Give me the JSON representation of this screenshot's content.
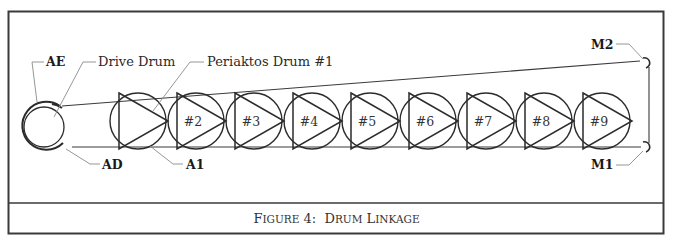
{
  "figure": {
    "caption": {
      "parts": [
        {
          "text": "F",
          "big": true
        },
        {
          "text": "IGURE",
          "big": false
        },
        {
          "text": " 4:  ",
          "big": true
        },
        {
          "text": "D",
          "big": true
        },
        {
          "text": "RUM",
          "big": false
        },
        {
          "text": " ",
          "big": true
        },
        {
          "text": "L",
          "big": true
        },
        {
          "text": "INKAGE",
          "big": false
        }
      ],
      "full_text": "Figure 4: Drum Linkage"
    },
    "callouts": {
      "ae": "AE",
      "drive_drum": "Drive Drum",
      "periaktos_drum_1": "Periaktos Drum #1",
      "ad": "AD",
      "a1": "A1",
      "m1": "M1",
      "m2": "M2"
    },
    "drums": [
      {
        "index": 1,
        "label": ""
      },
      {
        "index": 2,
        "label": "#2"
      },
      {
        "index": 3,
        "label": "#3"
      },
      {
        "index": 4,
        "label": "#4"
      },
      {
        "index": 5,
        "label": "#5"
      },
      {
        "index": 6,
        "label": "#6"
      },
      {
        "index": 7,
        "label": "#7"
      },
      {
        "index": 8,
        "label": "#8"
      },
      {
        "index": 9,
        "label": "#9"
      }
    ],
    "colors": {
      "stroke": "#2b2b2b",
      "leader": "#8a8a8a",
      "frame": "#3a3a3a"
    }
  }
}
